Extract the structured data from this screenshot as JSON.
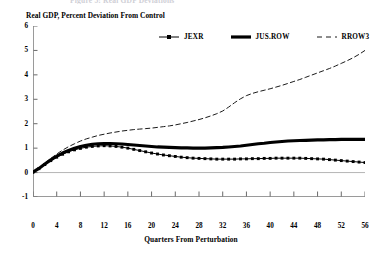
{
  "figure": {
    "title_fragment": "Figure 5: Real GDP Deviations",
    "subtitle": "Real GDP, Percent Deviation From Control"
  },
  "chart_data": {
    "type": "line",
    "title": "Real GDP, Percent Deviation From Control",
    "xlabel": "Quarters From Perturbation",
    "ylabel": "",
    "xlim": [
      0,
      56
    ],
    "ylim": [
      -1,
      6
    ],
    "xticks": [
      0,
      4,
      8,
      12,
      16,
      20,
      24,
      28,
      32,
      36,
      40,
      44,
      48,
      52,
      56
    ],
    "yticks": [
      -1,
      0,
      1,
      2,
      3,
      4,
      5,
      6
    ],
    "grid": false,
    "legend_position": "top-center",
    "zero_line": true,
    "x": [
      0,
      1,
      2,
      3,
      4,
      5,
      6,
      7,
      8,
      9,
      10,
      11,
      12,
      13,
      14,
      15,
      16,
      17,
      18,
      19,
      20,
      21,
      22,
      23,
      24,
      25,
      26,
      27,
      28,
      29,
      30,
      31,
      32,
      33,
      34,
      35,
      36,
      37,
      38,
      39,
      40,
      41,
      42,
      43,
      44,
      45,
      46,
      47,
      48,
      49,
      50,
      51,
      52,
      53,
      54,
      55,
      56
    ],
    "series": [
      {
        "name": "JEXR",
        "style": "line-markers",
        "color": "#000000",
        "values": [
          0.02,
          0.16,
          0.33,
          0.49,
          0.63,
          0.75,
          0.85,
          0.93,
          0.99,
          1.04,
          1.07,
          1.09,
          1.1,
          1.09,
          1.07,
          1.04,
          1.0,
          0.95,
          0.9,
          0.85,
          0.8,
          0.76,
          0.72,
          0.69,
          0.66,
          0.63,
          0.61,
          0.59,
          0.58,
          0.57,
          0.56,
          0.55,
          0.55,
          0.55,
          0.55,
          0.56,
          0.56,
          0.57,
          0.57,
          0.58,
          0.58,
          0.59,
          0.59,
          0.59,
          0.59,
          0.59,
          0.58,
          0.57,
          0.56,
          0.55,
          0.53,
          0.51,
          0.49,
          0.47,
          0.45,
          0.43,
          0.41
        ]
      },
      {
        "name": "JUS.ROW",
        "style": "thick-line",
        "color": "#000000",
        "values": [
          0.02,
          0.17,
          0.35,
          0.52,
          0.67,
          0.8,
          0.91,
          1.0,
          1.07,
          1.12,
          1.16,
          1.18,
          1.19,
          1.19,
          1.18,
          1.17,
          1.15,
          1.13,
          1.11,
          1.09,
          1.07,
          1.05,
          1.04,
          1.03,
          1.02,
          1.01,
          1.01,
          1.0,
          1.0,
          1.0,
          1.01,
          1.02,
          1.03,
          1.05,
          1.07,
          1.09,
          1.12,
          1.15,
          1.18,
          1.2,
          1.23,
          1.25,
          1.27,
          1.29,
          1.3,
          1.31,
          1.32,
          1.33,
          1.34,
          1.34,
          1.35,
          1.35,
          1.36,
          1.36,
          1.36,
          1.36,
          1.36
        ]
      },
      {
        "name": "RROW3",
        "style": "dashed-line",
        "color": "#000000",
        "values": [
          0.02,
          0.18,
          0.38,
          0.58,
          0.76,
          0.92,
          1.06,
          1.18,
          1.29,
          1.38,
          1.45,
          1.52,
          1.57,
          1.62,
          1.66,
          1.7,
          1.73,
          1.76,
          1.78,
          1.8,
          1.82,
          1.85,
          1.88,
          1.91,
          1.95,
          2.0,
          2.05,
          2.11,
          2.17,
          2.24,
          2.32,
          2.41,
          2.52,
          2.68,
          2.86,
          3.02,
          3.15,
          3.24,
          3.31,
          3.37,
          3.43,
          3.5,
          3.57,
          3.65,
          3.73,
          3.81,
          3.9,
          3.99,
          4.08,
          4.17,
          4.26,
          4.36,
          4.47,
          4.58,
          4.7,
          4.84,
          5.0
        ]
      }
    ]
  },
  "legend": {
    "items": [
      {
        "label": "JEXR"
      },
      {
        "label": "JUS.ROW"
      },
      {
        "label": "RROW3"
      }
    ]
  },
  "axes": {
    "y_tick_labels": [
      "6",
      "5",
      "4",
      "3",
      "2",
      "1",
      "0",
      "-1"
    ],
    "x_tick_labels": [
      "0",
      "4",
      "8",
      "12",
      "16",
      "20",
      "24",
      "28",
      "32",
      "36",
      "40",
      "44",
      "48",
      "52",
      "56"
    ],
    "x_title": "Quarters From Perturbation"
  }
}
